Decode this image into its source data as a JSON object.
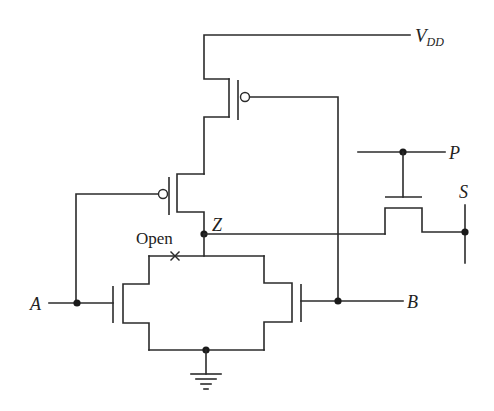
{
  "diagram": {
    "type": "CMOS transistor circuit with open-fault",
    "labels": {
      "vdd_main": "V",
      "vdd_sub": "DD",
      "input_a": "A",
      "input_b": "B",
      "output_z": "Z",
      "control_p": "P",
      "output_s": "S",
      "fault": "Open",
      "fault_marker": "×"
    },
    "components": [
      {
        "id": "pmos-b",
        "type": "PMOS",
        "gate": "B",
        "position": "top pull-up"
      },
      {
        "id": "pmos-a",
        "type": "PMOS",
        "gate": "A",
        "position": "second pull-up"
      },
      {
        "id": "nmos-a",
        "type": "NMOS",
        "gate": "A",
        "position": "pull-down left"
      },
      {
        "id": "nmos-b",
        "type": "NMOS",
        "gate": "B",
        "position": "pull-down right"
      },
      {
        "id": "pass-transistor",
        "type": "NMOS",
        "gate": "P",
        "connects": [
          "Z",
          "S"
        ]
      }
    ],
    "nodes": [
      "VDD",
      "Z",
      "A",
      "B",
      "P",
      "S",
      "GND"
    ],
    "colors": {
      "line": "#2b2b2b",
      "node_dot": "#1a1a1a",
      "background": "#ffffff"
    }
  }
}
